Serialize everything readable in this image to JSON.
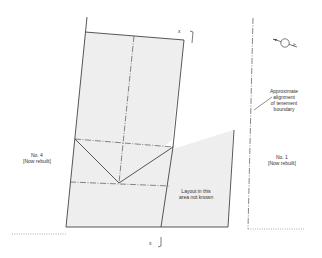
{
  "diagram": {
    "section_marks": {
      "top": "x",
      "bottom": "x"
    },
    "labels": {
      "left_property_line1": "No. 4",
      "left_property_line2": "[Now rebuilt]",
      "right_property_line1": "No. 1",
      "right_property_line2": "[Now rebuilt]",
      "unknown_area_line1": "Layout in this",
      "unknown_area_line2": "area not known",
      "boundary_note_line1": "Approximate",
      "boundary_note_line2": "alignment",
      "boundary_note_line3": "of tenement",
      "boundary_note_line4": "boundary"
    },
    "north_arrow": {
      "icon": "north-arrow-icon",
      "letter": "N"
    },
    "colors": {
      "line": "#444444",
      "fill": "#efefef",
      "text": "#333333"
    }
  }
}
